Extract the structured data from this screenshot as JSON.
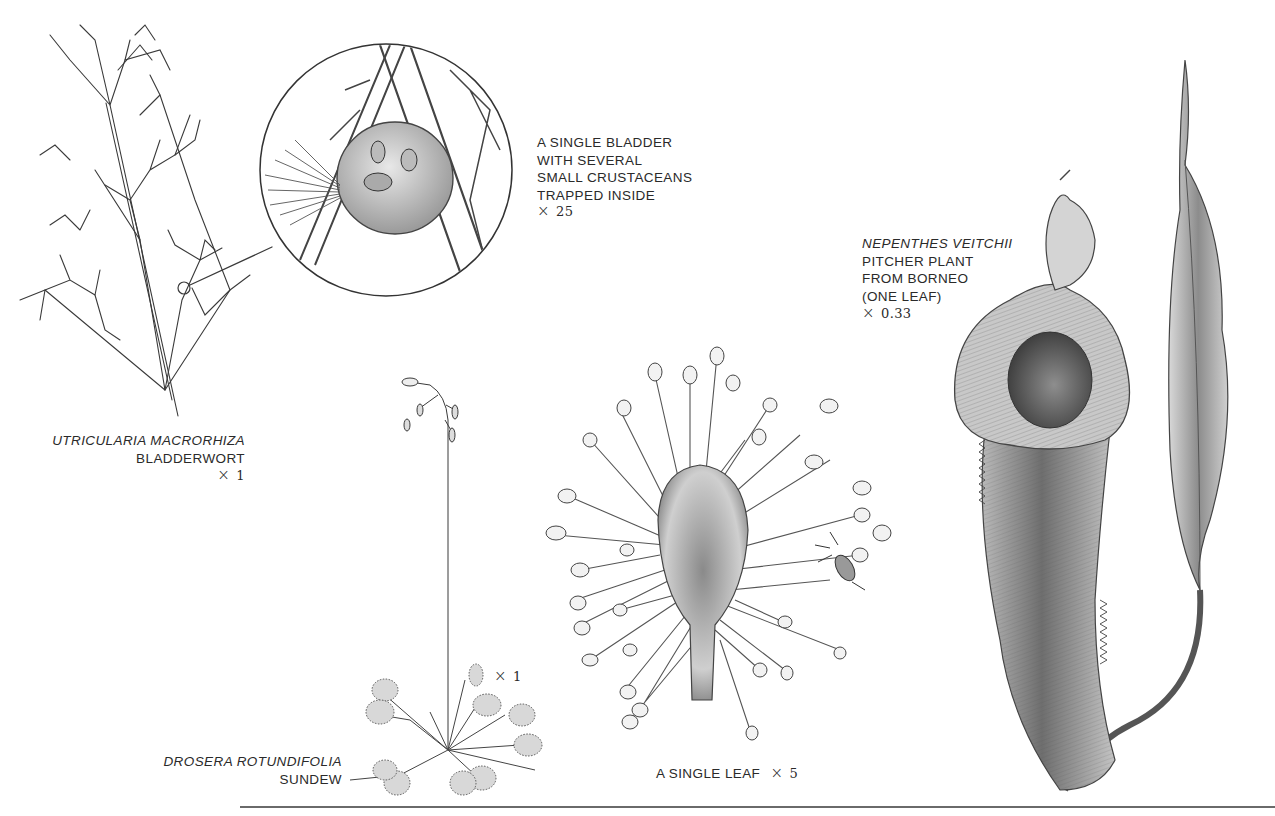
{
  "plate": {
    "background_color": "#ffffff",
    "ink_color": "#2a2a2a",
    "rule_color": "#6a6a6a"
  },
  "bladderwort": {
    "scientific_name": "UTRICULARIA MACRORHIZA",
    "common_name": "BLADDERWORT",
    "scale_symbol": "×",
    "scale_value": "1"
  },
  "bladder_detail": {
    "lines": [
      "A SINGLE BLADDER",
      "WITH SEVERAL",
      "SMALL CRUSTACEANS",
      "TRAPPED INSIDE"
    ],
    "scale_symbol": "×",
    "scale_value": "25"
  },
  "sundew": {
    "scientific_name": "DROSERA ROTUNDIFOLIA",
    "common_name": "SUNDEW",
    "scale_symbol": "×",
    "scale_value": "1"
  },
  "sundew_leaf": {
    "label": "A SINGLE LEAF",
    "scale_symbol": "×",
    "scale_value": "5"
  },
  "pitcher_plant": {
    "scientific_name": "NEPENTHES VEITCHII",
    "lines": [
      "PITCHER PLANT",
      "FROM BORNEO",
      "(ONE LEAF)"
    ],
    "scale_symbol": "×",
    "scale_value": "0.33"
  }
}
